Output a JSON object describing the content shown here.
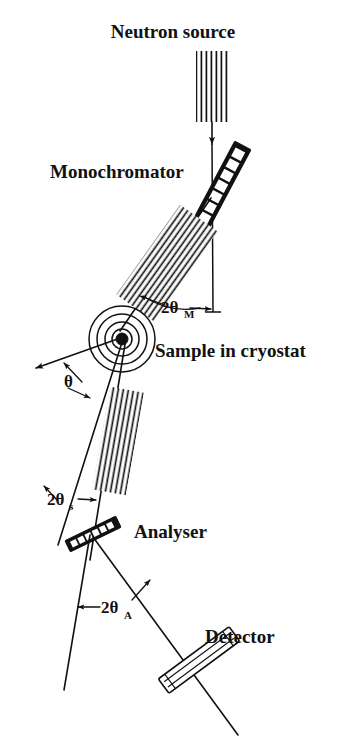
{
  "figure": {
    "background_color": "#ffffff",
    "ink_color": "#111111",
    "width": 346,
    "height": 750
  },
  "labels": {
    "neutron_source": "Neutron source",
    "monochromator": "Monochromator",
    "sample_in_cryostat": "Sample in cryostat",
    "analyser": "Analyser",
    "detector": "Detector"
  },
  "angles": {
    "two_theta_m": {
      "symbol": "2θ",
      "subscript": "M",
      "meaning": "monochromator scattering angle"
    },
    "theta": {
      "symbol": "θ",
      "subscript": "",
      "meaning": "sample rotation angle"
    },
    "two_theta_s": {
      "symbol": "2θ",
      "subscript": "s",
      "meaning": "sample scattering angle"
    },
    "two_theta_a": {
      "symbol": "2θ",
      "subscript": "A",
      "meaning": "analyser scattering angle"
    }
  },
  "components": {
    "collimator_1": {
      "name": "source collimator",
      "blade_count": 7
    },
    "collimator_2": {
      "name": "monochromator-to-sample collimator",
      "blade_count": 9
    },
    "collimator_3": {
      "name": "sample-to-analyser collimator",
      "blade_count": 7
    },
    "monochromator_crystal": {
      "name": "monochromator crystal",
      "cell_count": 9
    },
    "analyser_crystal": {
      "name": "analyser crystal",
      "cell_count": 6
    },
    "cryostat": {
      "name": "cryostat",
      "ring_count": 4
    },
    "detector_tube": {
      "name": "detector tube"
    }
  }
}
